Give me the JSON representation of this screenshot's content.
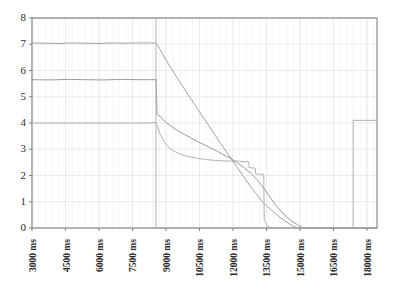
{
  "chart_data": {
    "type": "line",
    "title": "",
    "subtitle": "",
    "xlabel": "",
    "ylabel": "",
    "grid": true,
    "legend": false,
    "legend_position": "none",
    "xlim": [
      3000,
      18450
    ],
    "ylim": [
      0,
      8
    ],
    "x_unit": "ms",
    "x_tick_step": 1500,
    "y_tick_step": 1,
    "xticks": [
      3000,
      4500,
      6000,
      7500,
      9000,
      10500,
      12000,
      13500,
      15000,
      16500,
      18000
    ],
    "xtick_labels": [
      "3000 ms",
      "4500 ms",
      "6000 ms",
      "7500 ms",
      "9000 ms",
      "10500 ms",
      "12000 ms",
      "13500 ms",
      "15000 ms",
      "16500 ms",
      "18000 ms"
    ],
    "yticks": [
      0,
      1,
      2,
      3,
      4,
      5,
      6,
      7,
      8
    ],
    "ytick_labels": [
      "0",
      "1",
      "2",
      "3",
      "4",
      "5",
      "6",
      "7",
      "8"
    ],
    "colors": {
      "series_1": "#999999",
      "series_2": "#8e8e8e",
      "series_3": "#a8a8a8",
      "series_4": "#aaaaaa",
      "axis": "#808080",
      "grid_major": "#e9e9ef",
      "grid_minor": "#f2f2f6",
      "text": "#2b2b2b",
      "background": "#ffffff"
    },
    "series": [
      {
        "name": "series_1",
        "color": "#999999",
        "points": [
          [
            3000,
            7.05
          ],
          [
            3600,
            7.04
          ],
          [
            4200,
            7.03
          ],
          [
            4800,
            7.05
          ],
          [
            5400,
            7.04
          ],
          [
            6000,
            7.03
          ],
          [
            6600,
            7.05
          ],
          [
            7200,
            7.04
          ],
          [
            7800,
            7.05
          ],
          [
            8300,
            7.05
          ],
          [
            8560,
            7.05
          ],
          [
            8700,
            6.85
          ],
          [
            9000,
            6.4
          ],
          [
            9400,
            5.85
          ],
          [
            9900,
            5.2
          ],
          [
            10400,
            4.55
          ],
          [
            10900,
            3.92
          ],
          [
            11400,
            3.28
          ],
          [
            11900,
            2.66
          ],
          [
            12400,
            2.05
          ],
          [
            12900,
            1.45
          ],
          [
            13400,
            0.92
          ],
          [
            13900,
            0.55
          ],
          [
            14300,
            0.28
          ],
          [
            14650,
            0.1
          ],
          [
            14900,
            0.0
          ],
          [
            15400,
            0.0
          ],
          [
            16500,
            0.0
          ],
          [
            18450,
            0.0
          ]
        ]
      },
      {
        "name": "series_2",
        "color": "#8e8e8e",
        "points": [
          [
            3000,
            5.65
          ],
          [
            3800,
            5.64
          ],
          [
            4600,
            5.66
          ],
          [
            5400,
            5.65
          ],
          [
            6200,
            5.64
          ],
          [
            7000,
            5.66
          ],
          [
            7800,
            5.65
          ],
          [
            8300,
            5.65
          ],
          [
            8560,
            5.65
          ],
          [
            8600,
            4.32
          ],
          [
            8750,
            4.25
          ],
          [
            8950,
            4.05
          ],
          [
            9200,
            3.9
          ],
          [
            9500,
            3.72
          ],
          [
            9800,
            3.58
          ],
          [
            10100,
            3.44
          ],
          [
            10400,
            3.3
          ],
          [
            10700,
            3.18
          ],
          [
            11000,
            3.05
          ],
          [
            11300,
            2.92
          ],
          [
            11600,
            2.78
          ],
          [
            11900,
            2.65
          ],
          [
            12200,
            2.48
          ],
          [
            12500,
            2.3
          ],
          [
            12800,
            2.08
          ],
          [
            13100,
            1.82
          ],
          [
            13400,
            1.5
          ],
          [
            13700,
            1.12
          ],
          [
            14000,
            0.78
          ],
          [
            14300,
            0.5
          ],
          [
            14600,
            0.28
          ],
          [
            14900,
            0.12
          ],
          [
            15150,
            0.0
          ],
          [
            16000,
            0.0
          ],
          [
            18450,
            0.0
          ]
        ]
      },
      {
        "name": "series_3",
        "color": "#a8a8a8",
        "points": [
          [
            3000,
            4.0
          ],
          [
            3900,
            4.0
          ],
          [
            4800,
            4.0
          ],
          [
            5700,
            4.0
          ],
          [
            6600,
            4.0
          ],
          [
            7500,
            4.0
          ],
          [
            8200,
            4.0
          ],
          [
            8560,
            4.02
          ],
          [
            8620,
            3.86
          ],
          [
            8720,
            3.62
          ],
          [
            8840,
            3.4
          ],
          [
            8980,
            3.22
          ],
          [
            9140,
            3.06
          ],
          [
            9340,
            2.94
          ],
          [
            9560,
            2.84
          ],
          [
            9820,
            2.76
          ],
          [
            10100,
            2.7
          ],
          [
            10420,
            2.65
          ],
          [
            10760,
            2.61
          ],
          [
            11120,
            2.58
          ],
          [
            11500,
            2.56
          ],
          [
            11900,
            2.55
          ],
          [
            12300,
            2.55
          ],
          [
            12320,
            2.53
          ],
          [
            12700,
            2.52
          ],
          [
            12720,
            2.3
          ],
          [
            13000,
            2.28
          ],
          [
            13020,
            2.06
          ],
          [
            13380,
            2.04
          ],
          [
            13400,
            0.3
          ],
          [
            13560,
            0.06
          ],
          [
            13700,
            0.0
          ],
          [
            14500,
            0.0
          ],
          [
            16000,
            0.0
          ],
          [
            18450,
            0.0
          ]
        ]
      },
      {
        "name": "series_4",
        "color": "#aaaaaa",
        "points": [
          [
            3000,
            8.0
          ],
          [
            4500,
            8.0
          ],
          [
            6000,
            8.0
          ],
          [
            7500,
            8.0
          ],
          [
            8550,
            8.0
          ],
          [
            8550,
            0.0
          ],
          [
            9000,
            0.0
          ],
          [
            11000,
            0.0
          ],
          [
            13000,
            0.0
          ],
          [
            15000,
            0.0
          ],
          [
            17380,
            0.0
          ],
          [
            17380,
            4.1
          ],
          [
            18000,
            4.1
          ],
          [
            18450,
            4.1
          ]
        ]
      }
    ]
  }
}
